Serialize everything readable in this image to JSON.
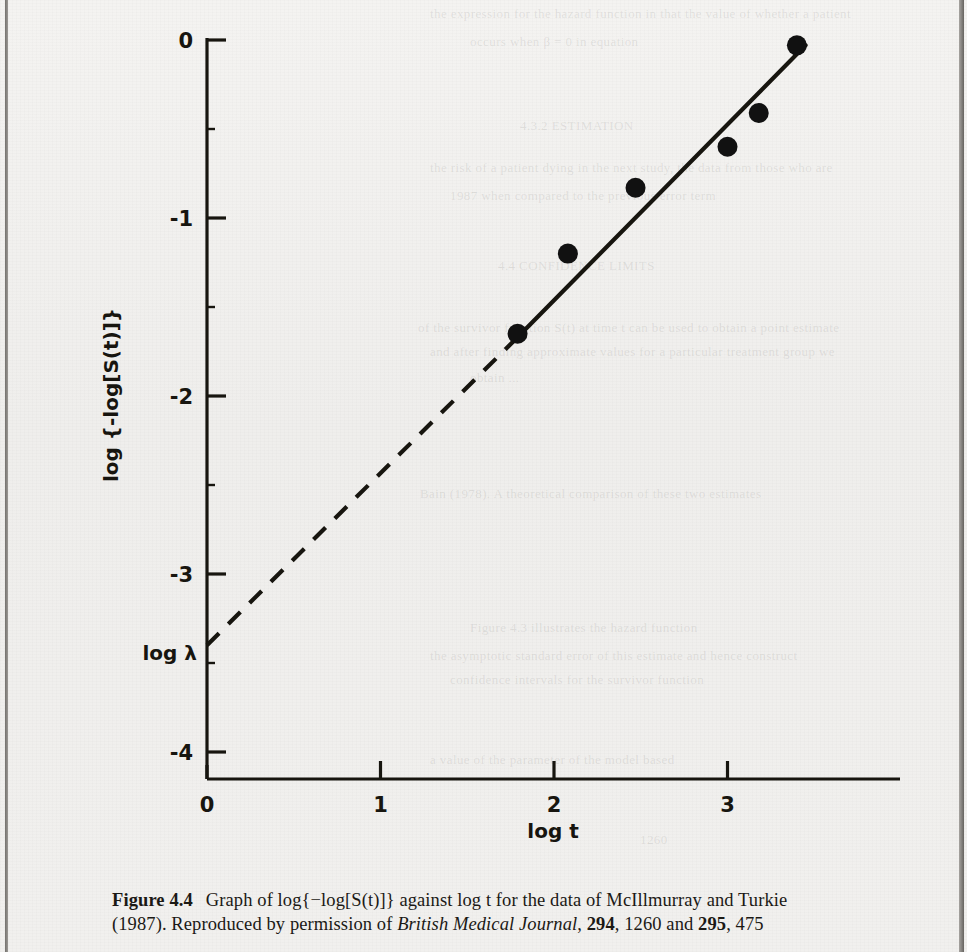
{
  "figure": {
    "number_label": "Figure 4.4",
    "caption_line1_parts": {
      "lead": "Graph of log{−log[S(t)]} against log t for the data of McIllmurray and Turkie"
    },
    "caption_line2_parts": {
      "year": "(1987). Reproduced by permission of ",
      "journal": "British Medical Journal",
      "vol1": "294",
      "page1": ", 1260 and ",
      "vol2": "295",
      "page2": ", 475"
    }
  },
  "chart_data": {
    "type": "scatter",
    "title": "",
    "xlabel": "log t",
    "ylabel": "log {-log[S(t)]}",
    "xlim": [
      0,
      3.6
    ],
    "ylim": [
      -4,
      0.1
    ],
    "xticks": [
      0,
      1,
      2,
      3
    ],
    "xticklabels": [
      "0",
      "1",
      "2",
      "3"
    ],
    "yticks": [
      0,
      -1,
      -2,
      -3,
      -4
    ],
    "yticklabels": [
      "0",
      "-1",
      "-2",
      "-3",
      "-4"
    ],
    "grid": false,
    "legend": "none",
    "points": [
      {
        "x": 1.79,
        "y": -1.65
      },
      {
        "x": 2.08,
        "y": -1.2
      },
      {
        "x": 2.47,
        "y": -0.83
      },
      {
        "x": 3.0,
        "y": -0.6
      },
      {
        "x": 3.18,
        "y": -0.41
      },
      {
        "x": 3.4,
        "y": -0.03
      }
    ],
    "fit_line": {
      "style": "solid",
      "x_start": 1.79,
      "y_start": -1.67,
      "x_end": 3.45,
      "y_end": -0.03
    },
    "extrapolation_line": {
      "style": "dashed",
      "x_start": 0.0,
      "y_start": -3.4,
      "x_end": 1.79,
      "y_end": -1.67
    },
    "annotations": [
      {
        "text": "log λ",
        "x": 0,
        "y": -3.44,
        "note": "intercept label on y-axis"
      }
    ],
    "marker": {
      "shape": "circle",
      "color": "#111111",
      "size": 10
    }
  },
  "colors": {
    "ink": "#17150f",
    "paper": "#f1f0ee",
    "marker": "#111111"
  },
  "bleed_text": {
    "row1": "the  expression  for  the  hazard  function  in  that  the  value  of  whether  a  patient",
    "row2": "occurs  when  β  =  0  in  equation",
    "row3": "4.3.2  ESTIMATION",
    "row4": "the  risk  of  a  patient  dying  in  the  next  study,  the  data  from  those  who  are",
    "row5": "1987  when  compared  to  the  previous  error  term",
    "row6": "4.4   CONFIDENCE  LIMITS",
    "row7": "of  the  survivor  function  S(t)  at  time  t  can  be  used  to  obtain  a  point  estimate",
    "row8": "and  after  finding  approximate  values  for  a  particular  treatment  group  we",
    "row9": "obtain  ...",
    "row10": "Bain  (1978). A  theoretical  comparison  of  these  two  estimates",
    "row11": "Figure  4.3   illustrates  the  hazard  function",
    "row12": "the  asymptotic  standard  error  of  this  estimate  and  hence  construct",
    "row13": "confidence  intervals  for  the  survivor  function",
    "row14": "a  value  of  the  parameter  of  the  model  based",
    "row15": "1260"
  }
}
